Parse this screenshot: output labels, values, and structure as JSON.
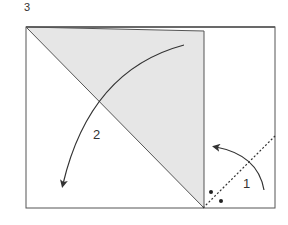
{
  "diagram": {
    "step_number": "3",
    "step1_label": "1",
    "step2_label": "2",
    "colors": {
      "paper_fill": "#e6e6e6",
      "outline": "#555555",
      "arrow": "#333333",
      "background": "#ffffff"
    }
  }
}
